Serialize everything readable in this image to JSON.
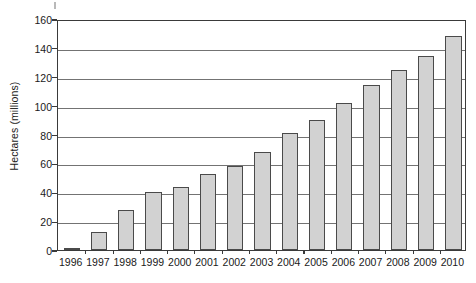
{
  "chart_data": {
    "type": "bar",
    "title": "",
    "subtitle": "",
    "xlabel": "",
    "ylabel": "Hectares (millions)",
    "categories": [
      "1996",
      "1997",
      "1998",
      "1999",
      "2000",
      "2001",
      "2002",
      "2003",
      "2004",
      "2005",
      "2006",
      "2007",
      "2008",
      "2009",
      "2010"
    ],
    "values": [
      1.7,
      12.5,
      27.5,
      40.0,
      44.0,
      52.5,
      58.5,
      68.0,
      81.0,
      90.0,
      102.0,
      114.5,
      125.0,
      134.5,
      148.0
    ],
    "ylim": [
      0,
      160
    ],
    "yticks": [
      0,
      20,
      40,
      60,
      80,
      100,
      120,
      140,
      160
    ],
    "ytick_labels": [
      "0",
      "20",
      "40",
      "60",
      "80",
      "100",
      "120",
      "140",
      "160"
    ],
    "grid": "horizontal",
    "legend": "none",
    "bar_fill_color": "#d2d2d2",
    "bar_border_color": "#4a4a4a",
    "gridline_color": "#737373",
    "axis_color": "#3a3a3a",
    "text_color": "#1a1a1a",
    "background_color": "#ffffff"
  }
}
